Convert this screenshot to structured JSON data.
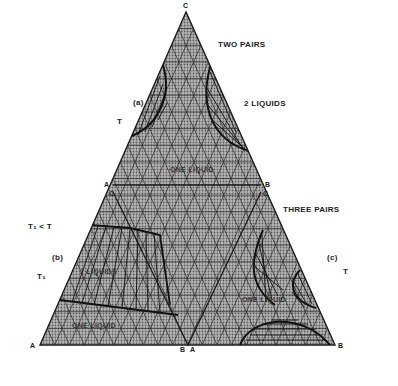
{
  "diagram": {
    "type": "ternary-phase-diagram",
    "vertices": {
      "top": "C",
      "bottom_left": "A",
      "bottom_right": "B"
    },
    "section_labels": {
      "two_pairs": "TWO PAIRS",
      "three_pairs": "THREE PAIRS"
    },
    "panels": {
      "a": {
        "tag": "(a)",
        "temp": "T",
        "region_label": "2 LIQUIDS",
        "one_liquid": "ONE LIQUID"
      },
      "b": {
        "tag": "(b)",
        "temp": "T₁",
        "temp_relation": "T₁ < T",
        "two_liquids": "2 LIQUIDS",
        "one_liquid": "ONE LIQUID"
      },
      "c": {
        "tag": "(c)",
        "temp": "T",
        "one_liquid": "ONE LIQUID"
      }
    },
    "edge_markers": {
      "left_A": "A",
      "left_C": "C",
      "right_B": "B",
      "right_C": "C",
      "bottom_B": "B",
      "bottom_A": "A",
      "corner_A": "A",
      "corner_B": "B",
      "apex_C": "C"
    },
    "colors": {
      "ink": "#1a1a1a",
      "fill": "#9a9a9a",
      "background": "#ffffff"
    }
  }
}
